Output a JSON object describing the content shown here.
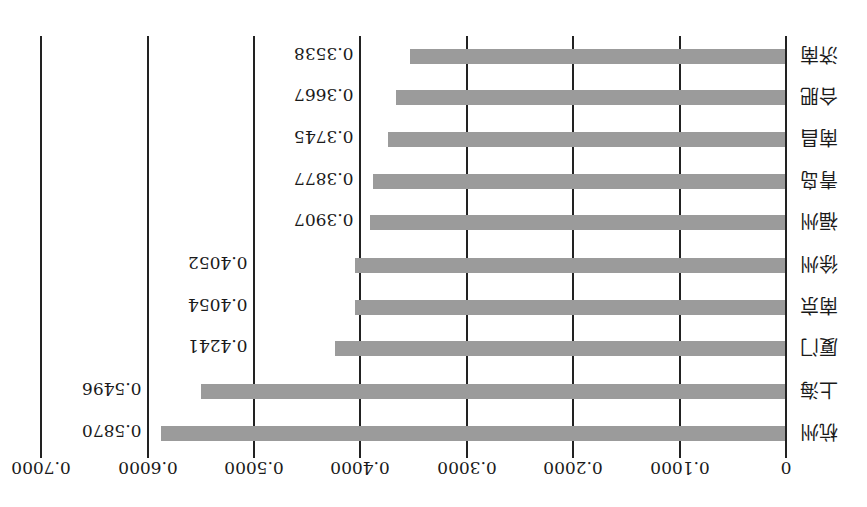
{
  "chart_data": {
    "type": "bar",
    "orientation": "horizontal",
    "rendered_rotation_deg": 180,
    "title": "",
    "xlabel": "",
    "ylabel": "",
    "categories": [
      "杭州",
      "上海",
      "厦门",
      "南京",
      "徐州",
      "福州",
      "青岛",
      "南昌",
      "合肥",
      "济南"
    ],
    "values": [
      0.587,
      0.5496,
      0.4241,
      0.4054,
      0.4052,
      0.3907,
      0.3877,
      0.3745,
      0.3667,
      0.3538
    ],
    "value_labels": [
      "0.5870",
      "0.5496",
      "0.4241",
      "0.4054",
      "0.4052",
      "0.3907",
      "0.3877",
      "0.3745",
      "0.3667",
      "0.3538"
    ],
    "xlim": [
      0,
      0.7
    ],
    "xticks": [
      0,
      0.1,
      0.2,
      0.3,
      0.4,
      0.5,
      0.6,
      0.7
    ],
    "xtick_labels": [
      "0",
      "0.1000",
      "0.2000",
      "0.3000",
      "0.4000",
      "0.5000",
      "0.6000",
      "0.7000"
    ],
    "grid": true,
    "legend": null,
    "bar_color": "#9b9b9b"
  },
  "display": {
    "rows_top_to_bottom": [
      {
        "label": "济南",
        "value": 0.3538,
        "value_label": "0.3538"
      },
      {
        "label": "合肥",
        "value": 0.3667,
        "value_label": "0.3667"
      },
      {
        "label": "南昌",
        "value": 0.3745,
        "value_label": "0.3745"
      },
      {
        "label": "青岛",
        "value": 0.3877,
        "value_label": "0.3877"
      },
      {
        "label": "福州",
        "value": 0.3907,
        "value_label": "0.3907"
      },
      {
        "label": "徐州",
        "value": 0.4052,
        "value_label": "0.4052"
      },
      {
        "label": "南京",
        "value": 0.4054,
        "value_label": "0.4054"
      },
      {
        "label": "厦门",
        "value": 0.4241,
        "value_label": "0.4241"
      },
      {
        "label": "上海",
        "value": 0.5496,
        "value_label": "0.5496"
      },
      {
        "label": "杭州",
        "value": 0.587,
        "value_label": "0.5870"
      }
    ]
  }
}
